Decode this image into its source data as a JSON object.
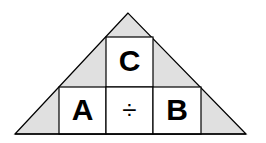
{
  "diagram": {
    "cells": {
      "top": "C",
      "bottom_left": "A",
      "bottom_middle": "÷",
      "bottom_right": "B"
    },
    "colors": {
      "fill": "#e0e0e0",
      "box": "#ffffff",
      "stroke": "#000000"
    }
  }
}
